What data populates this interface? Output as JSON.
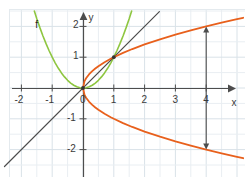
{
  "figure": {
    "background_color": "#ffffff",
    "grid_minor_color": "#e9eef2",
    "grid_major_color": "#d9e2e8",
    "axis_color": "#4d4d4d",
    "border_color": "#e4eaee"
  },
  "chart_data": {
    "type": "line",
    "title": "",
    "xlabel": "x",
    "ylabel": "y",
    "xlim": [
      -2.7,
      5.2
    ],
    "ylim": [
      -2.55,
      2.5
    ],
    "grid": true,
    "grid_step": 0.5,
    "legend": "none",
    "x_ticks": [
      -2,
      -1,
      0,
      1,
      2,
      3,
      4
    ],
    "x_tick_labels": [
      "-2",
      "-1",
      "0",
      "1",
      "2",
      "3",
      "4"
    ],
    "y_ticks": [
      -2,
      -1,
      1,
      2
    ],
    "y_tick_labels": [
      "-2",
      "-1",
      "1",
      "2"
    ],
    "annotations": [
      {
        "name": "function-label-f",
        "text": "f",
        "x": -1.55,
        "y": 2.22
      },
      {
        "name": "x-axis-name",
        "text": "x",
        "x": 4.82,
        "y": -0.33
      },
      {
        "name": "y-axis-name",
        "text": "y",
        "x": 0.18,
        "y": 2.42
      }
    ],
    "series": [
      {
        "name": "f",
        "label": "f",
        "equation": "y = x^2",
        "color": "#8ec640",
        "width": 1.6,
        "points": [
          [
            -1.58,
            2.5
          ],
          [
            -1.5,
            2.25
          ],
          [
            -1.4,
            1.96
          ],
          [
            -1.3,
            1.69
          ],
          [
            -1.2,
            1.44
          ],
          [
            -1.1,
            1.21
          ],
          [
            -1.0,
            1.0
          ],
          [
            -0.9,
            0.81
          ],
          [
            -0.8,
            0.64
          ],
          [
            -0.7,
            0.49
          ],
          [
            -0.6,
            0.36
          ],
          [
            -0.5,
            0.25
          ],
          [
            -0.4,
            0.16
          ],
          [
            -0.3,
            0.09
          ],
          [
            -0.2,
            0.04
          ],
          [
            -0.1,
            0.01
          ],
          [
            0.0,
            0.0
          ],
          [
            0.1,
            0.01
          ],
          [
            0.2,
            0.04
          ],
          [
            0.3,
            0.09
          ],
          [
            0.4,
            0.16
          ],
          [
            0.5,
            0.25
          ],
          [
            0.6,
            0.36
          ],
          [
            0.7,
            0.49
          ],
          [
            0.8,
            0.64
          ],
          [
            0.9,
            0.81
          ],
          [
            1.0,
            1.0
          ],
          [
            1.1,
            1.21
          ],
          [
            1.2,
            1.44
          ],
          [
            1.3,
            1.69
          ],
          [
            1.4,
            1.96
          ],
          [
            1.5,
            2.25
          ],
          [
            1.58,
            2.5
          ]
        ]
      },
      {
        "name": "identity-line",
        "label": "y = x",
        "equation": "y = x",
        "color": "#4c4c4c",
        "width": 1.2,
        "points": [
          [
            -2.55,
            -2.55
          ],
          [
            2.48,
            2.48
          ]
        ]
      },
      {
        "name": "inverse-upper-branch",
        "label": "y = sqrt(x)",
        "equation": "y = +sqrt(x)",
        "color": "#e8601c",
        "width": 1.8,
        "points": [
          [
            0.0,
            0.0
          ],
          [
            0.05,
            0.224
          ],
          [
            0.1,
            0.316
          ],
          [
            0.2,
            0.447
          ],
          [
            0.3,
            0.548
          ],
          [
            0.4,
            0.632
          ],
          [
            0.5,
            0.707
          ],
          [
            0.7,
            0.837
          ],
          [
            0.9,
            0.949
          ],
          [
            1.0,
            1.0
          ],
          [
            1.3,
            1.14
          ],
          [
            1.6,
            1.265
          ],
          [
            2.0,
            1.414
          ],
          [
            2.5,
            1.581
          ],
          [
            3.0,
            1.732
          ],
          [
            3.5,
            1.871
          ],
          [
            4.0,
            2.0
          ],
          [
            4.5,
            2.121
          ],
          [
            5.0,
            2.236
          ],
          [
            5.2,
            2.28
          ]
        ]
      },
      {
        "name": "inverse-lower-branch",
        "label": "y = -sqrt(x)",
        "equation": "y = -sqrt(x)",
        "color": "#e8601c",
        "width": 1.8,
        "points": [
          [
            0.0,
            -0.0
          ],
          [
            0.05,
            -0.224
          ],
          [
            0.1,
            -0.316
          ],
          [
            0.2,
            -0.447
          ],
          [
            0.3,
            -0.548
          ],
          [
            0.4,
            -0.632
          ],
          [
            0.5,
            -0.707
          ],
          [
            0.7,
            -0.837
          ],
          [
            0.9,
            -0.949
          ],
          [
            1.0,
            -1.0
          ],
          [
            1.3,
            -1.14
          ],
          [
            1.6,
            -1.265
          ],
          [
            2.0,
            -1.414
          ],
          [
            2.5,
            -1.581
          ],
          [
            3.0,
            -1.732
          ],
          [
            3.5,
            -1.871
          ],
          [
            4.0,
            -2.0
          ],
          [
            4.5,
            -2.121
          ],
          [
            5.0,
            -2.236
          ],
          [
            5.2,
            -2.28
          ]
        ]
      }
    ],
    "markers": [
      {
        "name": "intersection-origin",
        "x": 0,
        "y": 0,
        "color": "#333333"
      },
      {
        "name": "intersection-one-one",
        "x": 1,
        "y": 1,
        "color": "#333333"
      }
    ],
    "double_arrows": [
      {
        "name": "vertical-double-arrow-at-x-4",
        "x": 4,
        "y_from": -2.0,
        "y_to": 2.0,
        "color": "#4d4d4d"
      }
    ]
  }
}
